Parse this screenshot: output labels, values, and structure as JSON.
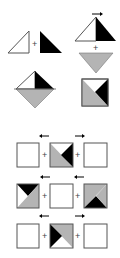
{
  "diagram": {
    "colors": {
      "white": "#ffffff",
      "black": "#000000",
      "gray": "#b4b4b4",
      "outline": "#555555"
    },
    "operator_symbol": "+",
    "step1": {
      "left_piece": "white right triangle",
      "right_piece": "black right triangle"
    },
    "step2": {
      "top_piece": "white/black triangle",
      "arrow": "right",
      "bottom_piece": "gray inverted triangle"
    },
    "step3": {
      "result": "diamond (white, black, gray)"
    },
    "step4": {
      "result": "square (white, black, gray)"
    },
    "rows": [
      {
        "left": "empty square",
        "left_arrow": "left",
        "middle": "gray/black square",
        "right_arrow": "right",
        "right": "empty square"
      },
      {
        "left": "black/white/gray square",
        "left_arrow": "left",
        "middle": "empty square",
        "right_arrow": "left",
        "right": "gray/black square"
      },
      {
        "left": "empty square",
        "left_arrow": "left",
        "middle": "black/gray square",
        "right_arrow": "right",
        "right": "empty square"
      }
    ]
  }
}
